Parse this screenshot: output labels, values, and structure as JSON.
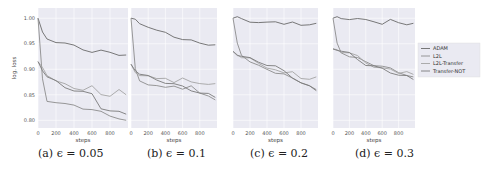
{
  "figure": {
    "captions": [
      "(a) ϵ = 0.05",
      "(b) ϵ = 0.1",
      "(c) ϵ = 0.2",
      "(d) ϵ = 0.3"
    ],
    "xlabel": "steps",
    "ylabel": "log. loss",
    "legend": [
      "ADAM",
      "L2L",
      "L2L-Transfer",
      "Transfer-NOT"
    ]
  },
  "chart_data": [
    {
      "type": "line",
      "title": "(a) ϵ = 0.05",
      "xlabel": "steps",
      "ylabel": "log. loss",
      "xticks": [
        0,
        200,
        400,
        600,
        800
      ],
      "yticks": [
        0.8,
        0.85,
        0.9,
        0.95,
        1.0
      ],
      "xlim": [
        0,
        1000
      ],
      "ylim": [
        0.785,
        1.02
      ],
      "grid": true,
      "x": [
        0,
        50,
        100,
        200,
        300,
        400,
        500,
        600,
        700,
        800,
        900,
        980
      ],
      "series": [
        {
          "name": "ADAM",
          "values": [
            1.0,
            0.97,
            0.96,
            0.955,
            0.95,
            0.945,
            0.94,
            0.935,
            0.935,
            0.932,
            0.93,
            0.928
          ]
        },
        {
          "name": "L2L",
          "values": [
            1.0,
            0.88,
            0.84,
            0.835,
            0.83,
            0.83,
            0.825,
            0.82,
            0.815,
            0.81,
            0.805,
            0.8
          ]
        },
        {
          "name": "L2L-Transfer",
          "values": [
            0.915,
            0.905,
            0.89,
            0.875,
            0.87,
            0.865,
            0.86,
            0.865,
            0.85,
            0.85,
            0.86,
            0.85
          ]
        },
        {
          "name": "Transfer-NOT",
          "values": [
            0.915,
            0.9,
            0.885,
            0.875,
            0.865,
            0.86,
            0.855,
            0.85,
            0.825,
            0.82,
            0.815,
            0.812
          ]
        }
      ],
      "legend_position": "none"
    },
    {
      "type": "line",
      "title": "(b) ϵ = 0.1",
      "xlabel": "steps",
      "ylabel": "",
      "xticks": [
        0,
        200,
        400,
        600,
        800
      ],
      "xlim": [
        0,
        1000
      ],
      "ylim": [
        0.785,
        1.02
      ],
      "grid": true,
      "x": [
        0,
        50,
        100,
        200,
        300,
        400,
        500,
        600,
        700,
        800,
        900,
        980
      ],
      "series": [
        {
          "name": "ADAM",
          "values": [
            1.0,
            0.995,
            0.99,
            0.985,
            0.975,
            0.97,
            0.965,
            0.96,
            0.955,
            0.95,
            0.95,
            0.948
          ]
        },
        {
          "name": "L2L",
          "values": [
            1.0,
            0.9,
            0.88,
            0.87,
            0.865,
            0.865,
            0.87,
            0.86,
            0.865,
            0.855,
            0.85,
            0.84
          ]
        },
        {
          "name": "L2L-Transfer",
          "values": [
            0.91,
            0.895,
            0.89,
            0.885,
            0.88,
            0.885,
            0.875,
            0.88,
            0.875,
            0.875,
            0.87,
            0.872
          ]
        },
        {
          "name": "Transfer-NOT",
          "values": [
            0.91,
            0.9,
            0.89,
            0.885,
            0.88,
            0.875,
            0.87,
            0.865,
            0.86,
            0.855,
            0.85,
            0.845
          ]
        }
      ],
      "legend_position": "none"
    },
    {
      "type": "line",
      "title": "(c) ϵ = 0.2",
      "xlabel": "steps",
      "ylabel": "",
      "xticks": [
        0,
        200,
        400,
        600,
        800
      ],
      "xlim": [
        0,
        1000
      ],
      "ylim": [
        0.785,
        1.02
      ],
      "grid": true,
      "x": [
        0,
        50,
        100,
        200,
        300,
        400,
        500,
        600,
        700,
        800,
        900,
        980
      ],
      "series": [
        {
          "name": "ADAM",
          "values": [
            1.0,
            1.0,
            1.0,
            0.995,
            0.99,
            0.99,
            0.995,
            0.99,
            0.99,
            0.985,
            0.99,
            0.99
          ]
        },
        {
          "name": "L2L",
          "values": [
            1.0,
            0.95,
            0.93,
            0.915,
            0.905,
            0.9,
            0.895,
            0.89,
            0.88,
            0.875,
            0.87,
            0.86
          ]
        },
        {
          "name": "L2L-Transfer",
          "values": [
            0.935,
            0.93,
            0.925,
            0.92,
            0.91,
            0.905,
            0.9,
            0.89,
            0.895,
            0.885,
            0.88,
            0.885
          ]
        },
        {
          "name": "Transfer-NOT",
          "values": [
            0.935,
            0.93,
            0.925,
            0.92,
            0.915,
            0.91,
            0.905,
            0.895,
            0.885,
            0.875,
            0.865,
            0.858
          ]
        }
      ],
      "legend_position": "none"
    },
    {
      "type": "line",
      "title": "(d) ϵ = 0.3",
      "xlabel": "steps",
      "ylabel": "",
      "xticks": [
        0,
        200,
        400,
        600,
        800
      ],
      "xlim": [
        0,
        1000
      ],
      "ylim": [
        0.785,
        1.02
      ],
      "grid": true,
      "x": [
        0,
        50,
        100,
        200,
        300,
        400,
        500,
        600,
        700,
        800,
        900,
        980
      ],
      "series": [
        {
          "name": "ADAM",
          "values": [
            1.0,
            1.0,
            1.0,
            1.0,
            0.998,
            0.995,
            0.995,
            0.99,
            0.995,
            0.99,
            0.99,
            0.99
          ]
        },
        {
          "name": "L2L",
          "values": [
            1.0,
            0.95,
            0.935,
            0.925,
            0.92,
            0.915,
            0.91,
            0.905,
            0.9,
            0.895,
            0.89,
            0.885
          ]
        },
        {
          "name": "L2L-Transfer",
          "values": [
            0.94,
            0.94,
            0.935,
            0.93,
            0.925,
            0.915,
            0.905,
            0.9,
            0.9,
            0.895,
            0.895,
            0.89
          ]
        },
        {
          "name": "Transfer-NOT",
          "values": [
            0.94,
            0.94,
            0.935,
            0.93,
            0.92,
            0.91,
            0.905,
            0.9,
            0.895,
            0.89,
            0.885,
            0.88
          ]
        }
      ],
      "legend_position": "right",
      "legend": [
        "ADAM",
        "L2L",
        "L2L-Transfer",
        "Transfer-NOT"
      ]
    }
  ],
  "colors": {
    "plot_bg": "#eaeaf2",
    "grid": "#ffffff",
    "series": [
      "#6a6a6a",
      "#8c8c8c",
      "#a4a4a4",
      "#7a7a7a"
    ]
  }
}
